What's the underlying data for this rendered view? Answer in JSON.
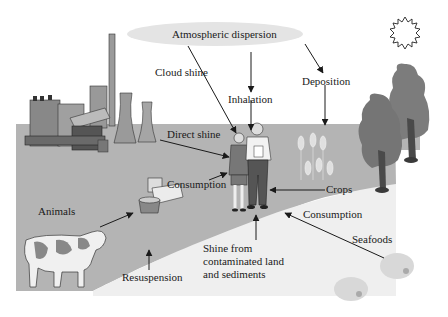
{
  "diagram": {
    "colors": {
      "background": "#ffffff",
      "ground": "#b4b4b4",
      "water": "#ececec",
      "cloud": "#e6e6e6",
      "arrow": "#1a1a1a",
      "tree": "#7c7c7c",
      "trunk": "#4a4a4a"
    },
    "labels": {
      "atmospheric_dispersion": "Atmospheric dispersion",
      "cloud_shine": "Cloud shine",
      "inhalation": "Inhalation",
      "deposition": "Deposition",
      "direct_shine": "Direct shine",
      "consumption_food": "Consumption",
      "crops": "Crops",
      "consumption_seafood": "Consumption",
      "animals": "Animals",
      "seafoods": "Seafoods",
      "resuspension": "Resuspension",
      "shine_from_land": "Shine from\ncontaminated land\nand sediments"
    },
    "icons": [
      "power-plant-icon",
      "sun-icon",
      "tree-icon",
      "cow-icon",
      "food-products-icon",
      "crops-icon",
      "people-icon",
      "seafood-icon",
      "cloud-icon"
    ]
  }
}
